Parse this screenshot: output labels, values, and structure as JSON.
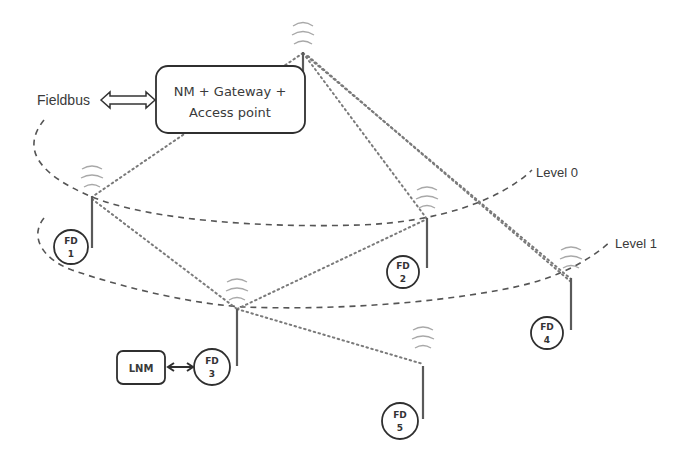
{
  "diagram": {
    "colors": {
      "ink": "#2f2f2f",
      "text": "#3a3a3a",
      "link": "#7a7a7a",
      "wave": "#a8a8a8"
    },
    "fieldbus": {
      "label": "Fieldbus"
    },
    "gateway": {
      "line1": "NM + Gateway +",
      "line2": "Access point",
      "icon": "antenna-icon"
    },
    "levels": [
      {
        "label": "Level 0"
      },
      {
        "label": "Level 1"
      }
    ],
    "lnm": {
      "label": "LNM"
    },
    "devices": [
      {
        "id": "FD1",
        "line1": "FD",
        "line2": "1",
        "level": "Level 0"
      },
      {
        "id": "FD2",
        "line1": "FD",
        "line2": "2",
        "level": "Level 0"
      },
      {
        "id": "FD3",
        "line1": "FD",
        "line2": "3",
        "level": "Level 1"
      },
      {
        "id": "FD4",
        "line1": "FD",
        "line2": "4",
        "level": "Level 1"
      },
      {
        "id": "FD5",
        "line1": "FD",
        "line2": "5",
        "level": "below Level 1"
      }
    ],
    "wireless_links": [
      [
        "Gateway",
        "FD1"
      ],
      [
        "Gateway",
        "FD2"
      ],
      [
        "Gateway",
        "FD4"
      ],
      [
        "FD1",
        "FD3"
      ],
      [
        "FD3",
        "FD2"
      ],
      [
        "FD3",
        "FD5"
      ]
    ],
    "wired_links": [
      [
        "Fieldbus",
        "Gateway"
      ],
      [
        "LNM",
        "FD3"
      ]
    ]
  }
}
